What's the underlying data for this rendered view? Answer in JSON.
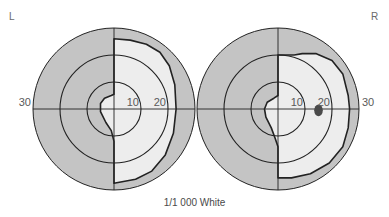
{
  "caption": "1/1 000 White",
  "colors": {
    "background": "#ffffff",
    "field_outer": "#c4c4c4",
    "field_seen": "#ededed",
    "line": "#222222",
    "blind_spot": "#4a4a4a",
    "text": "#5a5a5a"
  },
  "ring_degrees": [
    10,
    20,
    30
  ],
  "eyes": [
    {
      "id": "left",
      "label": "L",
      "ring_labels": [
        {
          "text": "10",
          "side": "right",
          "deg": 10
        },
        {
          "text": "20",
          "side": "right",
          "deg": 20
        },
        {
          "text": "30",
          "side": "left",
          "deg": 30
        }
      ],
      "field_polygon_deg": [
        [
          0,
          26
        ],
        [
          6,
          25.5
        ],
        [
          12,
          24
        ],
        [
          17,
          21
        ],
        [
          20.5,
          16
        ],
        [
          22.5,
          9
        ],
        [
          23,
          0
        ],
        [
          22,
          -9
        ],
        [
          19,
          -17
        ],
        [
          14,
          -23
        ],
        [
          8,
          -26
        ],
        [
          0,
          -27.5
        ],
        [
          0,
          -12
        ],
        [
          -1,
          -8
        ],
        [
          -3,
          -5
        ],
        [
          -5,
          -1
        ],
        [
          -5,
          2
        ],
        [
          -3.5,
          4
        ],
        [
          -1,
          5
        ],
        [
          0,
          5.5
        ],
        [
          0,
          26
        ]
      ],
      "blind_spot": null
    },
    {
      "id": "right",
      "label": "R",
      "ring_labels": [
        {
          "text": "10",
          "side": "right",
          "deg": 10
        },
        {
          "text": "20",
          "side": "right",
          "deg": 20
        },
        {
          "text": "30",
          "side": "right",
          "deg": 30
        }
      ],
      "field_polygon_deg": [
        [
          0,
          20
        ],
        [
          6,
          20
        ],
        [
          9,
          20.5
        ],
        [
          14,
          20.5
        ],
        [
          20,
          18
        ],
        [
          24,
          13
        ],
        [
          26,
          5
        ],
        [
          26.5,
          0
        ],
        [
          26,
          -7
        ],
        [
          24,
          -14
        ],
        [
          19,
          -20
        ],
        [
          12,
          -24
        ],
        [
          5,
          -25.5
        ],
        [
          0,
          -25.5
        ],
        [
          0,
          -14
        ],
        [
          -1,
          -11
        ],
        [
          -2.5,
          -7
        ],
        [
          -4.5,
          -3
        ],
        [
          -5,
          0
        ],
        [
          -4,
          2.5
        ],
        [
          -1.5,
          4
        ],
        [
          0,
          5
        ],
        [
          0,
          20
        ]
      ],
      "blind_spot": {
        "x_deg": 15,
        "y_deg": -0.5,
        "rx_deg": 1.6,
        "ry_deg": 2.2
      }
    }
  ]
}
